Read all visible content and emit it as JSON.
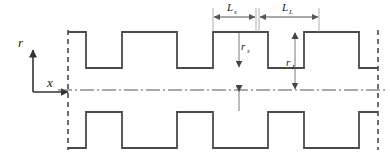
{
  "figure": {
    "stroke_color": "#4a4a4a",
    "dim_color": "#6b6b6b",
    "text_color": "#1a1a1a",
    "background": "#ffffff"
  },
  "axes": {
    "vertical": {
      "label": "r",
      "name": "radial-axis"
    },
    "horizontal": {
      "label": "x",
      "name": "axial-axis"
    }
  },
  "dimensions": {
    "small_length": {
      "label": "L",
      "subscript": "s",
      "name": "small-length-dimension"
    },
    "large_length": {
      "label": "L",
      "subscript": "L",
      "name": "large-length-dimension"
    },
    "small_radius": {
      "label": "r",
      "subscript": "s",
      "name": "small-radius-dimension"
    },
    "large_radius": {
      "label": "r",
      "subscript": "L",
      "name": "large-radius-dimension"
    }
  },
  "geometry": {
    "centerline_y": 90,
    "left_boundary_x": 68,
    "right_boundary_x": 378,
    "peak_y": 32,
    "trough_y": 68,
    "upper_profile": "M 68 32 L 86 32 L 86 68 L 122 68 L 122 32 L 177 32 L 177 68 L 213 68 L 213 32 L 268 32 L 268 68 L 304 68 L 304 32 L 359 32 L 359 68 L 378 68",
    "lower_profile": "M 68 148 L 86 148 L 86 112 L 122 112 L 122 148 L 177 148 L 177 112 L 213 112 L 213 148 L 268 148 L 268 112 L 304 112 L 304 148 L 359 148 L 359 112 L 378 112",
    "ls_span": [
      213,
      255
    ],
    "ll_span": [
      259,
      318
    ],
    "rs_x": 239,
    "rl_x": 295,
    "lower_arrow_x": 239
  }
}
